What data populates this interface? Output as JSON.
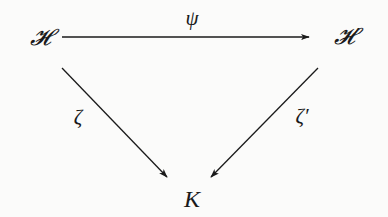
{
  "diagram": {
    "type": "commutative-triangle",
    "nodes": {
      "top_left": "𝓗",
      "top_right": "𝓗′",
      "bottom": "K"
    },
    "edges": {
      "top": {
        "from": "𝓗",
        "to": "𝓗′",
        "label": "ψ"
      },
      "left": {
        "from": "𝓗",
        "to": "K",
        "label": "ζ"
      },
      "right": {
        "from": "𝓗′",
        "to": "K",
        "label": "ζ′"
      }
    },
    "colors": {
      "background": "#fbfbfa",
      "ink": "#1a1a1a"
    }
  }
}
